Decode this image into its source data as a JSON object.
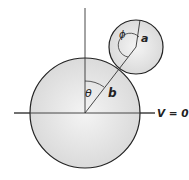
{
  "diagram": {
    "labels": {
      "theta": "θ",
      "phi": "ϕ",
      "large_radius": "b",
      "small_radius": "a",
      "potential": "V = 0"
    },
    "colors": {
      "sphere_fill": "#e6e6e6",
      "stroke": "#222222",
      "background": "#ffffff"
    }
  }
}
